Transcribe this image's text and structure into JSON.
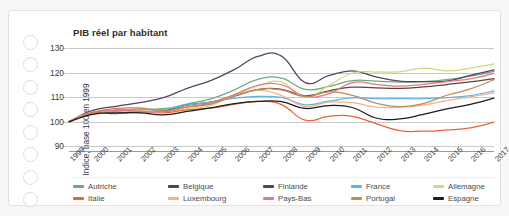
{
  "card": {
    "name": "gdp-per-capita-card"
  },
  "decorations": {
    "binder_holes": 8
  },
  "chart_data": {
    "type": "line",
    "title": "PIB réel par habitant",
    "ylabel": "Indice, base 100 en 1999",
    "xlabel": "",
    "ylim": [
      88,
      133
    ],
    "yticks": [
      90,
      100,
      110,
      120,
      130
    ],
    "grid": true,
    "legend_position": "bottom",
    "x": [
      1999,
      2000,
      2001,
      2002,
      2003,
      2004,
      2005,
      2006,
      2007,
      2008,
      2009,
      2010,
      2011,
      2012,
      2013,
      2014,
      2015,
      2016,
      2017
    ],
    "categories": [
      "1999",
      "2000",
      "2001",
      "2002",
      "2003",
      "2004",
      "2005",
      "2006",
      "2007",
      "2008",
      "2009",
      "2010",
      "2011",
      "2012",
      "2013",
      "2014",
      "2015",
      "2016",
      "2017"
    ],
    "series": [
      {
        "name": "Autriche",
        "color": "#6aab7e",
        "values": [
          100,
          103.8,
          104.4,
          105.2,
          105.3,
          107.2,
          109.3,
          113.0,
          117.3,
          117.8,
          113.2,
          114.4,
          116.8,
          116.6,
          116.2,
          116.4,
          117.2,
          118.6,
          120.6
        ]
      },
      {
        "name": "Belgique",
        "color": "#5e4436",
        "values": [
          100,
          103.4,
          103.3,
          104.0,
          104.4,
          106.8,
          108.0,
          110.4,
          113.1,
          113.2,
          110.6,
          112.6,
          114.1,
          113.8,
          113.6,
          114.2,
          115.2,
          116.3,
          117.6
        ]
      },
      {
        "name": "Finlande",
        "color": "#5b3f66",
        "values": [
          100,
          104.6,
          106.3,
          107.8,
          109.8,
          113.6,
          116.8,
          121.3,
          126.7,
          126.8,
          116.0,
          118.8,
          120.8,
          118.3,
          116.6,
          116.4,
          116.6,
          118.9,
          121.2
        ]
      },
      {
        "name": "France",
        "color": "#5bb5e8",
        "values": [
          100,
          103.2,
          104.2,
          104.8,
          105.0,
          106.8,
          108.0,
          109.5,
          110.3,
          109.9,
          106.9,
          108.4,
          109.7,
          109.4,
          109.4,
          109.4,
          109.8,
          110.7,
          112.6
        ]
      },
      {
        "name": "Allemagne",
        "color": "#cdd97f",
        "values": [
          100,
          103.2,
          104.7,
          104.5,
          103.8,
          105.3,
          106.6,
          110.9,
          114.6,
          116.2,
          109.9,
          114.8,
          119.9,
          120.3,
          120.4,
          121.9,
          120.8,
          121.9,
          123.6
        ]
      },
      {
        "name": "Italie",
        "color": "#ec6338",
        "values": [
          100,
          103.4,
          104.8,
          104.3,
          103.6,
          104.8,
          105.5,
          107.1,
          108.3,
          107.0,
          100.6,
          102.2,
          102.2,
          99.2,
          96.3,
          96.1,
          96.6,
          97.5,
          99.8
        ]
      },
      {
        "name": "Luxembourg",
        "color": "#f4b183",
        "values": [
          100,
          104.0,
          103.6,
          104.4,
          104.0,
          106.1,
          107.2,
          110.6,
          112.8,
          110.7,
          106.2,
          108.0,
          107.8,
          106.0,
          105.9,
          106.8,
          108.6,
          110.1,
          111.8
        ]
      },
      {
        "name": "Pays-Bas",
        "color": "#e8738c",
        "values": [
          100,
          103.8,
          104.5,
          104.2,
          104.0,
          106.0,
          107.7,
          111.1,
          114.9,
          115.1,
          110.4,
          111.4,
          116.0,
          115.3,
          114.5,
          115.3,
          116.4,
          117.5,
          119.8
        ]
      },
      {
        "name": "Portugal",
        "color": "#c08a5c",
        "values": [
          100,
          103.8,
          105.4,
          105.6,
          104.4,
          106.0,
          107.2,
          110.6,
          113.2,
          113.0,
          110.2,
          112.2,
          110.8,
          107.6,
          106.2,
          107.4,
          110.8,
          113.4,
          117.2
        ]
      },
      {
        "name": "Espagne",
        "color": "#1c1c1c",
        "values": [
          100,
          103.0,
          103.6,
          103.6,
          102.8,
          104.2,
          105.6,
          107.4,
          108.3,
          108.2,
          105.4,
          106.6,
          105.8,
          101.5,
          101.1,
          103.0,
          105.2,
          107.1,
          109.6
        ]
      }
    ]
  }
}
